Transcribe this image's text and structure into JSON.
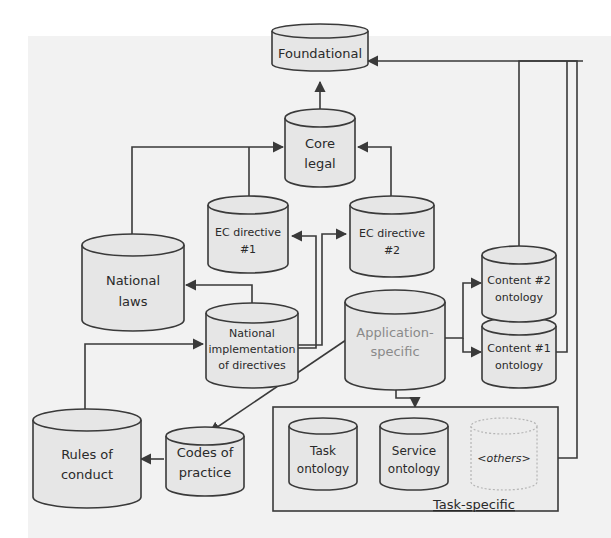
{
  "diagram": {
    "type": "ontology-layer-architecture",
    "colors": {
      "background": "#f2f2f2",
      "page": "#ffffff",
      "cylinder_fill": "#e6e6e6",
      "stroke": "#3a3a3a",
      "faded_text": "#8a8a8a",
      "dashed_stroke": "#b5b5b5"
    },
    "nodes": {
      "foundational": {
        "label": "Foundational"
      },
      "core_legal": {
        "line1": "Core",
        "line2": "legal"
      },
      "ec_directive_1": {
        "line1": "EC directive",
        "line2": "#1"
      },
      "ec_directive_2": {
        "line1": "EC directive",
        "line2": "#2"
      },
      "national_laws": {
        "line1": "National",
        "line2": "laws"
      },
      "national_impl": {
        "line1": "National",
        "line2": "implementation",
        "line3": "of directives"
      },
      "application_specific": {
        "line1": "Application-",
        "line2": "specific"
      },
      "content_2": {
        "line1": "Content #2",
        "line2": "ontology"
      },
      "content_1": {
        "line1": "Content #1",
        "line2": "ontology"
      },
      "rules_of_conduct": {
        "line1": "Rules of",
        "line2": "conduct"
      },
      "codes_of_practice": {
        "line1": "Codes of",
        "line2": "practice"
      },
      "task_ontology": {
        "line1": "Task",
        "line2": "ontology"
      },
      "service_ontology": {
        "line1": "Service",
        "line2": "ontology"
      },
      "others": {
        "label": "<others>"
      }
    },
    "groups": {
      "task_specific": {
        "label": "Task-specific"
      }
    },
    "edges": [
      {
        "from": "core_legal",
        "to": "foundational"
      },
      {
        "from": "national_laws",
        "to": "core_legal"
      },
      {
        "from": "ec_directive_1",
        "to": "core_legal"
      },
      {
        "from": "ec_directive_2",
        "to": "core_legal"
      },
      {
        "from": "national_impl",
        "to": "national_laws"
      },
      {
        "from": "national_impl",
        "to": "ec_directive_1"
      },
      {
        "from": "national_impl",
        "to": "ec_directive_2"
      },
      {
        "from": "rules_of_conduct",
        "to": "national_impl"
      },
      {
        "from": "codes_of_practice",
        "to": "rules_of_conduct"
      },
      {
        "from": "application_specific",
        "to": "codes_of_practice"
      },
      {
        "from": "application_specific",
        "to": "content_2"
      },
      {
        "from": "application_specific",
        "to": "content_1"
      },
      {
        "from": "application_specific",
        "to": "task_specific"
      },
      {
        "from": "content_2",
        "to": "foundational"
      },
      {
        "from": "content_1",
        "to": "foundational"
      },
      {
        "from": "task_specific",
        "to": "foundational"
      }
    ]
  }
}
